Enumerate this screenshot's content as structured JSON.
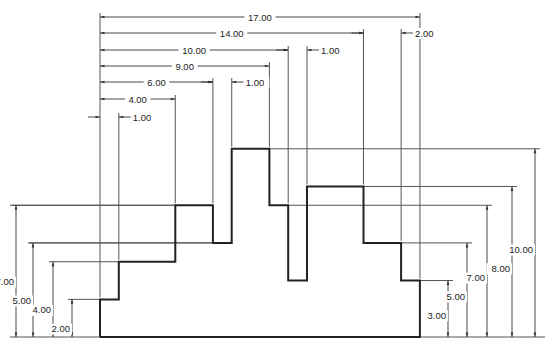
{
  "drawing": {
    "type": "dimensioned step profile",
    "units_label": "in",
    "origin_px": [
      100,
      337
    ],
    "scale_px_per_unit": 18.82,
    "colors": {
      "object_line": "#222222",
      "dimension_line": "#333333",
      "extension_line": "#555555",
      "background": "#ffffff"
    },
    "profile_points": [
      [
        0,
        0
      ],
      [
        0,
        2
      ],
      [
        1,
        2
      ],
      [
        1,
        4
      ],
      [
        4,
        4
      ],
      [
        4,
        7
      ],
      [
        6,
        7
      ],
      [
        6,
        5
      ],
      [
        7,
        5
      ],
      [
        7,
        10
      ],
      [
        9,
        10
      ],
      [
        9,
        7
      ],
      [
        10,
        7
      ],
      [
        10,
        3
      ],
      [
        11,
        3
      ],
      [
        11,
        8
      ],
      [
        14,
        8
      ],
      [
        14,
        5
      ],
      [
        16,
        5
      ],
      [
        16,
        3
      ],
      [
        17,
        3
      ],
      [
        17,
        0
      ],
      [
        0,
        0
      ]
    ]
  },
  "horizontal_dims": [
    {
      "label": "17.00",
      "from": 0,
      "to": 17,
      "y": 17
    },
    {
      "label": "14.00",
      "from": 0,
      "to": 14,
      "y": 33
    },
    {
      "label": "2.00",
      "from": 14,
      "to": 16,
      "y": 33,
      "style": "outside"
    },
    {
      "label": "10.00",
      "from": 0,
      "to": 10,
      "y": 50
    },
    {
      "label": "1.00",
      "from": 10,
      "to": 11,
      "y": 50,
      "style": "outside"
    },
    {
      "label": "9.00",
      "from": 0,
      "to": 9,
      "y": 66
    },
    {
      "label": "6.00",
      "from": 0,
      "to": 6,
      "y": 82
    },
    {
      "label": "1.00",
      "from": 6,
      "to": 7,
      "y": 82,
      "style": "outside"
    },
    {
      "label": "4.00",
      "from": 0,
      "to": 4,
      "y": 99
    },
    {
      "label": "1.00",
      "from": 0,
      "to": 1,
      "y": 117,
      "style": "outside"
    }
  ],
  "vertical_dims_left": [
    {
      "label": "7.00",
      "height": 7,
      "x": 16
    },
    {
      "label": "5.00",
      "height": 5,
      "x": 33
    },
    {
      "label": "4.00",
      "height": 4,
      "x": 53
    },
    {
      "label": "2.00",
      "height": 2,
      "x": 72
    }
  ],
  "vertical_dims_right": [
    {
      "label": "3.00",
      "height": 3,
      "x": 448
    },
    {
      "label": "5.00",
      "height": 5,
      "x": 467
    },
    {
      "label": "7.00",
      "height": 7,
      "x": 487
    },
    {
      "label": "8.00",
      "height": 8,
      "x": 512
    },
    {
      "label": "10.00",
      "height": 10,
      "x": 535
    }
  ]
}
